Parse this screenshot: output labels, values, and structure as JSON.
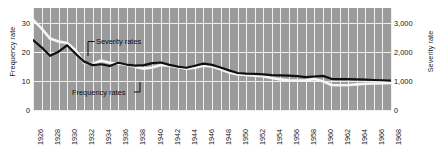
{
  "chart_data": {
    "type": "line",
    "title": "",
    "xlabel": "",
    "ylabel": "Frequency rate",
    "y2label": "Severity rate",
    "grid": true,
    "legend_position": "inline-annotations",
    "xlim": [
      1926,
      1968
    ],
    "ylim": [
      0,
      35
    ],
    "y2lim": [
      0,
      3500
    ],
    "yticks": [
      0,
      10,
      20,
      30
    ],
    "ytick_labels": [
      "0",
      "10",
      "20",
      "30"
    ],
    "y2ticks": [
      0,
      1000,
      2000,
      3000
    ],
    "y2tick_labels": [
      "0",
      "1,000",
      "2,000",
      "3,000"
    ],
    "xticks": [
      1926,
      1928,
      1930,
      1932,
      1934,
      1936,
      1938,
      1940,
      1942,
      1944,
      1946,
      1948,
      1950,
      1952,
      1954,
      1956,
      1958,
      1960,
      1962,
      1964,
      1966,
      1968
    ],
    "xtick_labels": [
      "1926",
      "1928",
      "1930",
      "1932",
      "1934",
      "1936",
      "1938",
      "1940",
      "1942",
      "1944",
      "1946",
      "1948",
      "1950",
      "1952",
      "1954",
      "1956",
      "1958",
      "1960",
      "1962",
      "1964",
      "1966",
      "1968"
    ],
    "x": [
      1926,
      1927,
      1928,
      1929,
      1930,
      1931,
      1932,
      1933,
      1934,
      1935,
      1936,
      1937,
      1938,
      1939,
      1940,
      1941,
      1942,
      1943,
      1944,
      1945,
      1946,
      1947,
      1948,
      1949,
      1950,
      1951,
      1952,
      1953,
      1954,
      1955,
      1956,
      1957,
      1958,
      1959,
      1960,
      1961,
      1962,
      1963,
      1964,
      1965,
      1966,
      1967,
      1968
    ],
    "series": [
      {
        "name": "Frequency rates",
        "axis": "left",
        "color": "#101010",
        "values": [
          24.0,
          21.5,
          18.6,
          20.0,
          22.2,
          19.3,
          16.6,
          15.4,
          15.7,
          15.1,
          16.2,
          15.6,
          15.2,
          15.4,
          16.1,
          16.3,
          15.5,
          14.9,
          14.5,
          15.2,
          15.9,
          15.5,
          14.6,
          13.6,
          12.7,
          12.5,
          12.4,
          12.2,
          12.0,
          11.9,
          11.8,
          11.6,
          11.3,
          11.5,
          11.7,
          10.7,
          10.6,
          10.6,
          10.5,
          10.4,
          10.3,
          10.2,
          10.1
        ]
      },
      {
        "name": "Severity rates",
        "axis": "right",
        "color": "#f5f5f5",
        "values": [
          3100,
          2800,
          2450,
          2350,
          2300,
          2050,
          1620,
          1580,
          1700,
          1620,
          1580,
          1560,
          1480,
          1420,
          1460,
          1540,
          1520,
          1470,
          1420,
          1450,
          1520,
          1490,
          1400,
          1290,
          1220,
          1200,
          1180,
          1160,
          1100,
          1050,
          1020,
          1010,
          1020,
          1060,
          990,
          860,
          850,
          860,
          880,
          900,
          910,
          920,
          930
        ]
      }
    ],
    "annotations": [
      {
        "name": "severity-rates-label",
        "text": "Severity rates"
      },
      {
        "name": "frequency-rates-label",
        "text": "Frequency rates"
      }
    ],
    "style": {
      "plot_background": "#9b9b9b",
      "gridline_color": "#f0f0f0",
      "frequency_color": "#101010",
      "severity_color": "#f5f5f5",
      "page_background": "#ffffff"
    }
  }
}
